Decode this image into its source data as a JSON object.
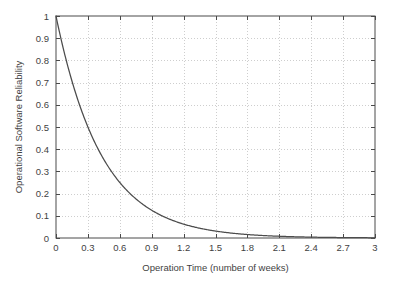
{
  "chart_data": {
    "type": "line",
    "title": "",
    "xlabel": "Operation Time (number of weeks)",
    "ylabel": "Operational Software Reliability",
    "xlim": [
      0,
      3
    ],
    "ylim": [
      0,
      1
    ],
    "grid": true,
    "legend": "none",
    "xticks": [
      "0",
      "0.3",
      "0.6",
      "0.9",
      "1.2",
      "1.5",
      "1.8",
      "2.1",
      "2.4",
      "2.7",
      "3"
    ],
    "xtick_values": [
      0,
      0.3,
      0.6,
      0.9,
      1.2,
      1.5,
      1.8,
      2.1,
      2.4,
      2.7,
      3
    ],
    "yticks": [
      "0",
      "0.1",
      "0.2",
      "0.3",
      "0.4",
      "0.5",
      "0.6",
      "0.7",
      "0.8",
      "0.9",
      "1"
    ],
    "ytick_values": [
      0,
      0.1,
      0.2,
      0.3,
      0.4,
      0.5,
      0.6,
      0.7,
      0.8,
      0.9,
      1
    ],
    "series": [
      {
        "name": "Reliability decay",
        "model": "R(t) = exp(-2.31 * t)",
        "x": [
          0,
          0.1,
          0.2,
          0.3,
          0.4,
          0.5,
          0.6,
          0.7,
          0.8,
          0.9,
          1.0,
          1.1,
          1.2,
          1.3,
          1.4,
          1.5,
          1.6,
          1.7,
          1.8,
          1.9,
          2.0,
          2.1,
          2.2,
          2.3,
          2.4,
          2.5,
          2.6,
          2.7,
          2.8,
          2.9,
          3.0
        ],
        "values": [
          1.0,
          0.794,
          0.63,
          0.5,
          0.397,
          0.315,
          0.25,
          0.198,
          0.157,
          0.125,
          0.099,
          0.079,
          0.063,
          0.05,
          0.039,
          0.031,
          0.025,
          0.02,
          0.016,
          0.012,
          0.0098,
          0.0078,
          0.0062,
          0.0049,
          0.0039,
          0.0031,
          0.0025,
          0.0019,
          0.0015,
          0.0012,
          0.001
        ]
      }
    ],
    "colors": {
      "line": "#4c4c4c",
      "frame": "#4a4a4a",
      "grid": "#b9b9b9",
      "background": "#ffffff",
      "text": "#3f3f3f"
    }
  }
}
